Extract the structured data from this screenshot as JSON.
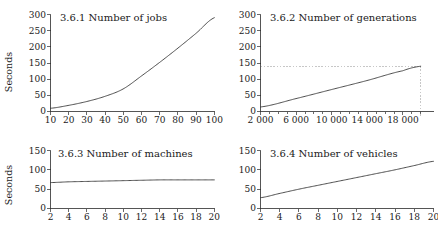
{
  "figure": {
    "background": "#ffffff",
    "line_color": "#3a3a3a",
    "axis_color": "#2b2b2b",
    "guide_color": "#b9b9b9"
  },
  "panels": [
    {
      "id": "panel-jobs",
      "title": "3.6.1 Number of jobs",
      "ylabel": "Seconds",
      "xlabel": "",
      "yticks": [
        "0",
        "50",
        "100",
        "150",
        "200",
        "250",
        "300"
      ],
      "xticks": [
        "10",
        "20",
        "30",
        "40",
        "50",
        "60",
        "70",
        "80",
        "90",
        "100"
      ]
    },
    {
      "id": "panel-generations",
      "title": "3.6.2 Number of generations",
      "ylabel": "",
      "xlabel": "",
      "yticks": [
        "0",
        "50",
        "100",
        "150",
        "200",
        "250",
        "300"
      ],
      "xticks": [
        "2 000",
        "6 000",
        "10 000",
        "14 000",
        "18 000"
      ]
    },
    {
      "id": "panel-machines",
      "title": "3.6.3 Number of machines",
      "ylabel": "Seconds",
      "xlabel": "",
      "yticks": [
        "0",
        "50",
        "100",
        "150"
      ],
      "xticks": [
        "2",
        "4",
        "6",
        "8",
        "10",
        "12",
        "14",
        "16",
        "18",
        "20"
      ]
    },
    {
      "id": "panel-vehicles",
      "title": "3.6.4 Number of vehicles",
      "ylabel": "",
      "xlabel": "",
      "yticks": [
        "0",
        "50",
        "100",
        "150"
      ],
      "xticks": [
        "2",
        "4",
        "6",
        "8",
        "10",
        "12",
        "14",
        "16",
        "18",
        "20"
      ]
    }
  ],
  "chart_data": [
    {
      "type": "line",
      "title": "3.6.1 Number of jobs",
      "xlabel": "Number of jobs",
      "ylabel": "Seconds",
      "xlim": [
        10,
        100
      ],
      "ylim": [
        0,
        300
      ],
      "xticks": [
        10,
        20,
        30,
        40,
        50,
        60,
        70,
        80,
        90,
        100
      ],
      "yticks": [
        0,
        50,
        100,
        150,
        200,
        250,
        300
      ],
      "grid": false,
      "legend": "none",
      "series": [
        {
          "name": "runtime",
          "x": [
            10,
            20,
            30,
            40,
            50,
            60,
            70,
            80,
            90,
            100
          ],
          "values": [
            10,
            19,
            31,
            47,
            70,
            110,
            152,
            196,
            242,
            290
          ]
        }
      ]
    },
    {
      "type": "line",
      "title": "3.6.2 Number of generations",
      "xlabel": "Number of generations",
      "ylabel": "Seconds",
      "xlim": [
        2000,
        20000
      ],
      "ylim": [
        0,
        300
      ],
      "xticks": [
        2000,
        6000,
        10000,
        14000,
        18000
      ],
      "yticks": [
        0,
        50,
        100,
        150,
        200,
        250,
        300
      ],
      "grid": false,
      "legend": "none",
      "annotations": [
        {
          "type": "hline",
          "y": 140,
          "style": "dashed",
          "color": "#b9b9b9"
        },
        {
          "type": "vline",
          "x": 20000,
          "style": "dashed",
          "color": "#b9b9b9"
        }
      ],
      "series": [
        {
          "name": "runtime",
          "x": [
            2000,
            6000,
            10000,
            14000,
            18000,
            20000
          ],
          "values": [
            14,
            40,
            68,
            96,
            126,
            140
          ]
        }
      ]
    },
    {
      "type": "line",
      "title": "3.6.3 Number of machines",
      "xlabel": "Number of machines",
      "ylabel": "Seconds",
      "xlim": [
        2,
        20
      ],
      "ylim": [
        0,
        150
      ],
      "xticks": [
        2,
        4,
        6,
        8,
        10,
        12,
        14,
        16,
        18,
        20
      ],
      "yticks": [
        0,
        50,
        100,
        150
      ],
      "grid": false,
      "legend": "none",
      "series": [
        {
          "name": "runtime",
          "x": [
            2,
            4,
            6,
            8,
            10,
            12,
            14,
            16,
            18,
            20
          ],
          "values": [
            67,
            69,
            70,
            71,
            72,
            73,
            74,
            74,
            74,
            74
          ]
        }
      ]
    },
    {
      "type": "line",
      "title": "3.6.4 Number of vehicles",
      "xlabel": "Number of vehicles",
      "ylabel": "Seconds",
      "xlim": [
        2,
        20
      ],
      "ylim": [
        0,
        150
      ],
      "xticks": [
        2,
        4,
        6,
        8,
        10,
        12,
        14,
        16,
        18,
        20
      ],
      "yticks": [
        0,
        50,
        100,
        150
      ],
      "grid": false,
      "legend": "none",
      "series": [
        {
          "name": "runtime",
          "x": [
            2,
            4,
            6,
            8,
            10,
            12,
            14,
            16,
            18,
            20
          ],
          "values": [
            28,
            39,
            50,
            60,
            70,
            80,
            90,
            100,
            111,
            122
          ]
        }
      ]
    }
  ]
}
